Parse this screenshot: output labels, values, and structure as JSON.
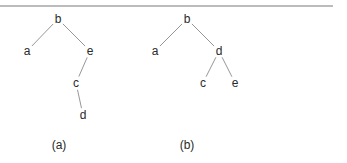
{
  "figure": {
    "trees": [
      {
        "caption": "(a)",
        "nodes": [
          {
            "id": "b",
            "label": "b"
          },
          {
            "id": "a",
            "label": "a"
          },
          {
            "id": "e",
            "label": "e"
          },
          {
            "id": "c",
            "label": "c"
          },
          {
            "id": "d",
            "label": "d"
          }
        ],
        "edges": [
          [
            "b",
            "a"
          ],
          [
            "b",
            "e"
          ],
          [
            "e",
            "c"
          ],
          [
            "c",
            "d"
          ]
        ]
      },
      {
        "caption": "(b)",
        "nodes": [
          {
            "id": "b",
            "label": "b"
          },
          {
            "id": "a",
            "label": "a"
          },
          {
            "id": "d",
            "label": "d"
          },
          {
            "id": "c",
            "label": "c"
          },
          {
            "id": "e",
            "label": "e"
          }
        ],
        "edges": [
          [
            "b",
            "a"
          ],
          [
            "b",
            "d"
          ],
          [
            "d",
            "c"
          ],
          [
            "d",
            "e"
          ]
        ]
      }
    ]
  }
}
